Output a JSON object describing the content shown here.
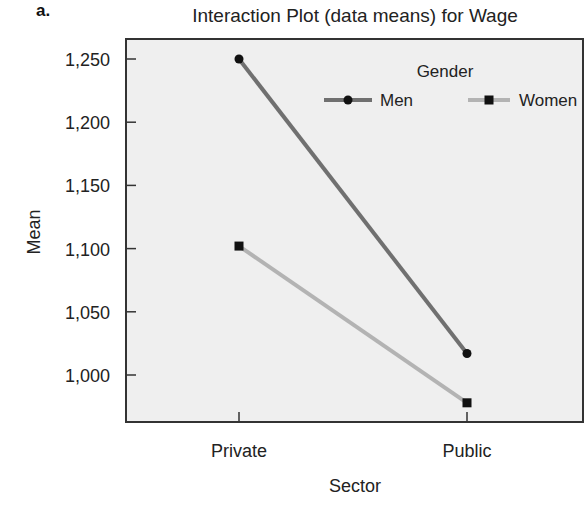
{
  "figure": {
    "panel_label": "a."
  },
  "chart_data": {
    "type": "line",
    "title": "Interaction Plot (data means) for Wage",
    "xlabel": "Sector",
    "ylabel": "Mean",
    "categories": [
      "Private",
      "Public"
    ],
    "series": [
      {
        "name": "Men",
        "marker": "circle",
        "color": "#707070",
        "values": [
          1250,
          1017
        ]
      },
      {
        "name": "Women",
        "marker": "square",
        "color": "#b3b3b3",
        "values": [
          1102,
          978
        ]
      }
    ],
    "yticks": [
      1000,
      1050,
      1100,
      1150,
      1200,
      1250
    ],
    "ytick_labels": [
      "1,000",
      "1,050",
      "1,100",
      "1,150",
      "1,200",
      "1,250"
    ],
    "ylim": [
      966,
      1266
    ],
    "grid": false,
    "legend": {
      "title": "Gender",
      "position": "upper right, inside plot",
      "entries": [
        "Men",
        "Women"
      ]
    },
    "plot_background": "#efefef"
  }
}
